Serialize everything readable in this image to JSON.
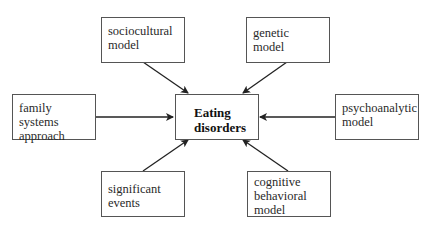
{
  "diagram": {
    "center": {
      "label_line1": "Eating",
      "label_line2": "disorders"
    },
    "nodes": [
      {
        "id": "sociocultural",
        "line1": "sociocultural",
        "line2": "model"
      },
      {
        "id": "genetic",
        "line1": "genetic model"
      },
      {
        "id": "family",
        "line1": "family systems",
        "line2": "approach"
      },
      {
        "id": "psychoanalytic",
        "line1": "psychoanalytic",
        "line2": "model"
      },
      {
        "id": "significant",
        "line1": "significant",
        "line2": "events"
      },
      {
        "id": "cognitive",
        "line1": "cognitive",
        "line2": "behavioral",
        "line3": "model"
      }
    ],
    "edges": [
      {
        "from": "sociocultural model",
        "to": "Eating disorders"
      },
      {
        "from": "genetic model",
        "to": "Eating disorders"
      },
      {
        "from": "family systems approach",
        "to": "Eating disorders"
      },
      {
        "from": "psychoanalytic model",
        "to": "Eating disorders"
      },
      {
        "from": "significant events",
        "to": "Eating disorders"
      },
      {
        "from": "cognitive behavioral model",
        "to": "Eating disorders"
      }
    ],
    "colors": {
      "stroke": "#222222",
      "box_border": "#555555",
      "background": "#ffffff"
    }
  }
}
